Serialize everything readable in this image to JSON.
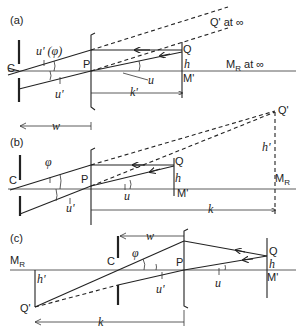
{
  "panels": [
    {
      "id": "a",
      "tag": "(a)",
      "labels": {
        "C": "C",
        "P": "P",
        "Q": "Q",
        "h": "h",
        "M_prime": "M'",
        "u_prime_phi": "u' (φ)",
        "u_prime": "u'",
        "u": "u",
        "k_prime": "k'",
        "Q_prime": "Q' at ∞",
        "M_R": "M",
        "M_R_sub": "R",
        "M_R_suffix": " at ∞"
      }
    },
    {
      "id": "b",
      "tag": "(b)",
      "labels": {
        "C": "C",
        "P": "P",
        "Q": "Q",
        "h": "h",
        "M_prime": "M'",
        "phi": "φ",
        "u_prime": "u'",
        "u": "u",
        "k": "k",
        "w": "w",
        "Q_prime": "Q'",
        "h_prime": "h'",
        "M_R": "M",
        "M_R_sub": "R"
      }
    },
    {
      "id": "c",
      "tag": "(c)",
      "labels": {
        "C": "C",
        "P": "P",
        "Q": "Q",
        "h": "h",
        "M_prime": "M'",
        "phi": "φ",
        "u_prime": "u'",
        "u": "u",
        "k": "k",
        "w": "w",
        "Q_prime": "Q'",
        "h_prime": "h'",
        "M_R": "M",
        "M_R_sub": "R"
      }
    }
  ]
}
